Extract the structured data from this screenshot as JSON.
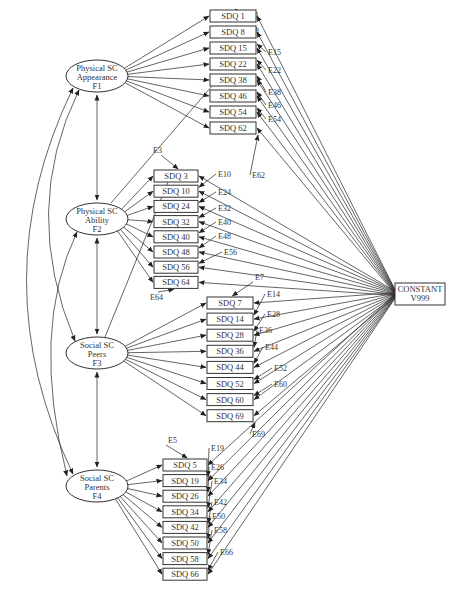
{
  "figure": {
    "factors": [
      {
        "id": "F1",
        "lines": [
          "Physical SC",
          "Appearance",
          "F1"
        ],
        "cx": 97,
        "cy": 76,
        "rx": 31,
        "ry": 16,
        "items": [
          "SDQ 1",
          "SDQ 8",
          "SDQ 15",
          "SDQ 22",
          "SDQ 38",
          "SDQ 46",
          "SDQ 54",
          "SDQ 62"
        ]
      },
      {
        "id": "F2",
        "lines": [
          "Physical SC",
          "Ability",
          "F2"
        ],
        "cx": 97,
        "cy": 219,
        "rx": 31,
        "ry": 16,
        "items": [
          "SDQ 3",
          "SDQ 10",
          "SDQ 24",
          "SDQ 32",
          "SDQ 40",
          "SDQ 48",
          "SDQ 56",
          "SDQ 64"
        ]
      },
      {
        "id": "F3",
        "lines": [
          "Social SC",
          "Peers",
          "F3"
        ],
        "cx": 97,
        "cy": 353,
        "rx": 31,
        "ry": 16,
        "items": [
          "SDQ 7",
          "SDQ 14",
          "SDQ 28",
          "SDQ 36",
          "SDQ 44",
          "SDQ 52",
          "SDQ 60",
          "SDQ 69"
        ]
      },
      {
        "id": "F4",
        "lines": [
          "Social SC",
          "Parents",
          "F4"
        ],
        "cx": 97,
        "cy": 486,
        "rx": 31,
        "ry": 16,
        "items": [
          "SDQ 5",
          "SDQ 19",
          "SDQ 26",
          "SDQ 34",
          "SDQ 42",
          "SDQ 50",
          "SDQ 58",
          "SDQ 66"
        ]
      }
    ],
    "item_groups": [
      {
        "x": 210,
        "y0": 10,
        "dy": 16,
        "w": 46,
        "h": 12,
        "errors": [
          "E1",
          "E8",
          "E15",
          "E22",
          "E38",
          "E46",
          "E54",
          "E62"
        ]
      },
      {
        "x": 154,
        "y0": 170,
        "dy": 15.2,
        "w": 44,
        "h": 12,
        "errors": [
          "E3",
          "E10",
          "E24",
          "E32",
          "E40",
          "E48",
          "E56",
          "E64"
        ]
      },
      {
        "x": 207,
        "y0": 297,
        "dy": 16.1,
        "w": 46,
        "h": 12,
        "errors": [
          "E7",
          "E14",
          "E28",
          "E36",
          "E44",
          "E52",
          "E60",
          "E69"
        ]
      },
      {
        "x": 163,
        "y0": 459,
        "dy": 15.6,
        "w": 44,
        "h": 12,
        "errors": [
          "E5",
          "E19",
          "E26",
          "E34",
          "E42",
          "E50",
          "E58",
          "E66"
        ]
      }
    ],
    "constant": {
      "lines": [
        "CONSTANT",
        "V999"
      ],
      "x": 395,
      "y": 283,
      "w": 50,
      "h": 22
    },
    "error_labels": [
      {
        "t": "E1",
        "x": 250,
        "y": 18
      },
      {
        "t": "E8",
        "x": 250,
        "y": 34
      },
      {
        "t": "E15",
        "x": 268,
        "y": 55
      },
      {
        "t": "E22",
        "x": 268,
        "y": 73
      },
      {
        "t": "E38",
        "x": 268,
        "y": 95
      },
      {
        "t": "E46",
        "x": 268,
        "y": 108
      },
      {
        "t": "E54",
        "x": 268,
        "y": 122
      },
      {
        "t": "E62",
        "x": 252,
        "y": 178
      },
      {
        "t": "E3",
        "x": 153,
        "y": 153
      },
      {
        "t": "E10",
        "x": 218,
        "y": 177
      },
      {
        "t": "E24",
        "x": 218,
        "y": 195
      },
      {
        "t": "E32",
        "x": 218,
        "y": 211
      },
      {
        "t": "E40",
        "x": 218,
        "y": 225
      },
      {
        "t": "E48",
        "x": 218,
        "y": 239
      },
      {
        "t": "E56",
        "x": 224,
        "y": 255
      },
      {
        "t": "E64",
        "x": 150,
        "y": 300
      },
      {
        "t": "E7",
        "x": 255,
        "y": 280
      },
      {
        "t": "E14",
        "x": 267,
        "y": 297
      },
      {
        "t": "E28",
        "x": 267,
        "y": 317
      },
      {
        "t": "E36",
        "x": 259,
        "y": 333
      },
      {
        "t": "E44",
        "x": 265,
        "y": 350
      },
      {
        "t": "E52",
        "x": 274,
        "y": 371
      },
      {
        "t": "E60",
        "x": 274,
        "y": 387
      },
      {
        "t": "E69",
        "x": 252,
        "y": 437
      },
      {
        "t": "E5",
        "x": 168,
        "y": 443
      },
      {
        "t": "E19",
        "x": 211,
        "y": 451
      },
      {
        "t": "E26",
        "x": 211,
        "y": 470
      },
      {
        "t": "E34",
        "x": 214,
        "y": 484
      },
      {
        "t": "E42",
        "x": 214,
        "y": 505
      },
      {
        "t": "E50",
        "x": 212,
        "y": 519
      },
      {
        "t": "E58",
        "x": 214,
        "y": 533
      },
      {
        "t": "E66",
        "x": 220,
        "y": 555
      }
    ],
    "colors": {
      "stroke": "#222222",
      "text": "#333333",
      "background": "#ffffff"
    }
  }
}
